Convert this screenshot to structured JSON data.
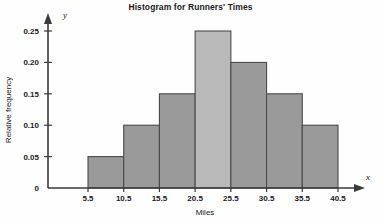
{
  "chart_data": {
    "type": "bar",
    "title": "Histogram for Runners' Times",
    "xlabel": "Miles",
    "ylabel": "Relative frequency",
    "x_axis_letter": "y",
    "y_axis_letter": "x",
    "grid": false,
    "legend": "none",
    "bin_edges": [
      5.5,
      10.5,
      15.5,
      20.5,
      25.5,
      30.5,
      35.5,
      40.5
    ],
    "categories": [
      "5.5-10.5",
      "10.5-15.5",
      "15.5-20.5",
      "20.5-25.5",
      "25.5-30.5",
      "30.5-35.5",
      "35.5-40.5"
    ],
    "values": [
      0.05,
      0.1,
      0.15,
      0.25,
      0.2,
      0.15,
      0.1
    ],
    "bar_colors": [
      "#9a9a9a",
      "#9a9a9a",
      "#9a9a9a",
      "#b9b9b9",
      "#9a9a9a",
      "#9a9a9a",
      "#9a9a9a"
    ],
    "bar_edge_color": "#4a4a4a",
    "xlim": [
      5.5,
      40.5
    ],
    "ylim": [
      0,
      0.27
    ],
    "xticks": [
      5.5,
      10.5,
      15.5,
      20.5,
      25.5,
      30.5,
      35.5,
      40.5
    ],
    "xtick_labels": [
      "5.5",
      "10.5",
      "15.5",
      "20.5",
      "25.5",
      "30.5",
      "35.5",
      "40.5"
    ],
    "yticks": [
      0,
      0.05,
      0.1,
      0.15,
      0.2,
      0.25
    ],
    "ytick_labels": [
      "0",
      "0.05",
      "0.10",
      "0.15",
      "0.20",
      "0.25"
    ]
  }
}
